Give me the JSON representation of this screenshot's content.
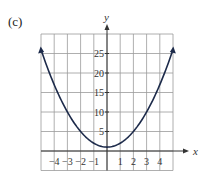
{
  "panel_label": "(c)",
  "chart_data": {
    "type": "line",
    "title": "",
    "xlabel": "x",
    "ylabel": "y",
    "function": "y = x^2 + 1",
    "x": [
      -5,
      -4,
      -3,
      -2,
      -1,
      0,
      1,
      2,
      3,
      4,
      5
    ],
    "values": [
      26,
      17,
      10,
      5,
      2,
      1,
      2,
      5,
      10,
      17,
      26
    ],
    "xlim": [
      -5,
      5
    ],
    "ylim": [
      -5,
      30
    ],
    "x_ticks": [
      "-4",
      "-3",
      "-2",
      "-1",
      "1",
      "2",
      "3",
      "4"
    ],
    "y_ticks": [
      "5",
      "10",
      "15",
      "20",
      "25"
    ],
    "grid": true,
    "arrows_on_curve_ends": true,
    "colors": {
      "curve": "#1c2a4a",
      "grid": "#9a9a9a",
      "axis": "#333333"
    }
  }
}
